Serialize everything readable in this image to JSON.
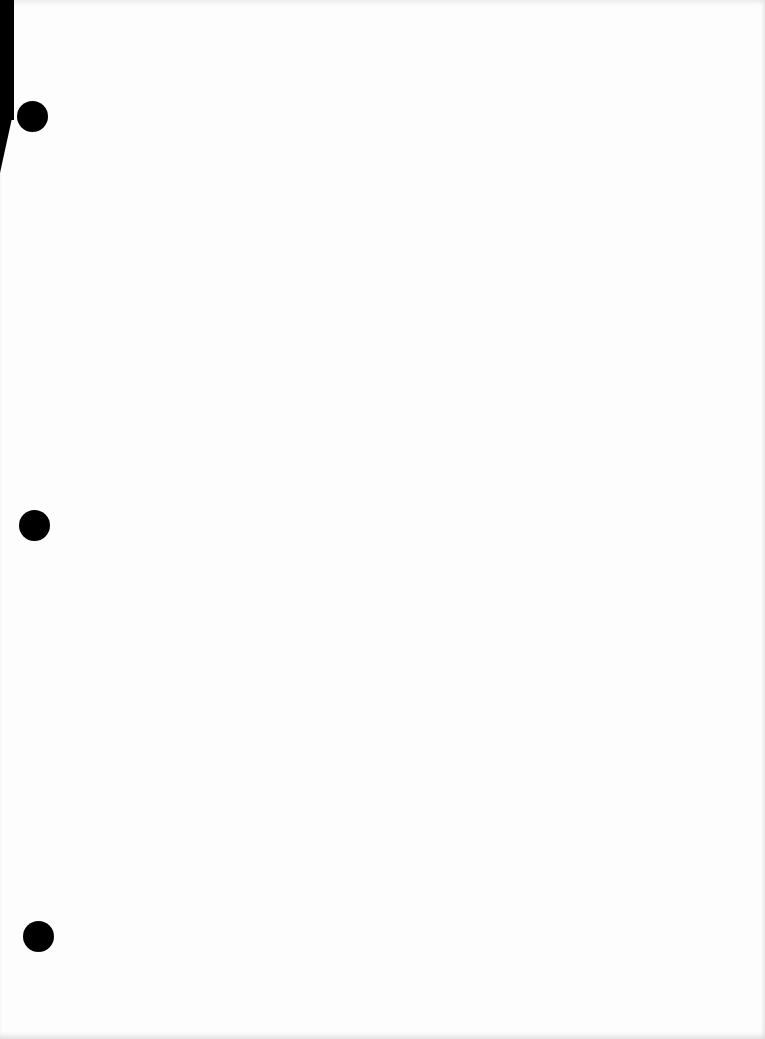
{
  "page": {
    "type": "blank scanned page",
    "background_color": "#fdfdfd",
    "text": ""
  },
  "punch_holes": [
    {
      "x": 32,
      "y": 117
    },
    {
      "x": 34,
      "y": 525
    },
    {
      "x": 38,
      "y": 937
    }
  ],
  "colors": {
    "hole": "#000000",
    "edge": "#000000"
  }
}
